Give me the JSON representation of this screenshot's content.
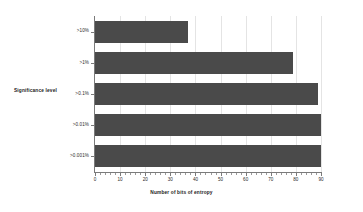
{
  "chart_data": {
    "type": "bar",
    "orientation": "horizontal",
    "title": "",
    "xlabel": "Number of bits of entropy",
    "ylabel": "Significance level",
    "categories": [
      ">10%",
      ">1%",
      ">0.1%",
      ">0.01%",
      ">0.001%"
    ],
    "values": [
      37,
      79,
      89,
      90,
      90
    ],
    "xlim": [
      0,
      90
    ],
    "xticks": [
      0,
      10,
      20,
      30,
      40,
      50,
      60,
      70,
      80,
      90
    ],
    "xticklabels": [
      "0",
      "10",
      "20",
      "30",
      "40",
      "50",
      "60",
      "70",
      "80",
      "90"
    ],
    "minor_ticks_per_interval": 5,
    "grid": "vertical",
    "legend": "none",
    "bar_color": "#4a4a4a",
    "grid_color": "#e4e4e4",
    "axis_color": "#7a7a7a",
    "background_color": "#ffffff",
    "text_color": "#2b2b2b"
  }
}
